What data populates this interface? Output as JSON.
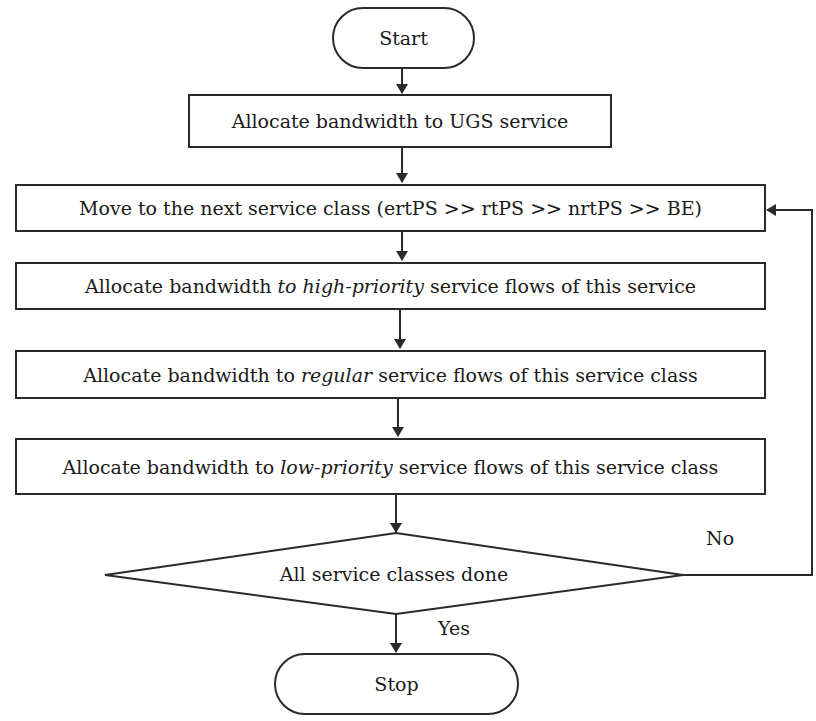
{
  "diagram": {
    "type": "flowchart",
    "nodes": {
      "start": {
        "label": "Start",
        "shape": "terminal"
      },
      "ugs": {
        "label": "Allocate bandwidth to UGS service",
        "shape": "process"
      },
      "next_class": {
        "label": "Move to the next service class (ertPS >> rtPS >> nrtPS >> BE)",
        "shape": "process"
      },
      "high_priority": {
        "pre": "Allocate bandwidth ",
        "em": "to high-priority",
        "post": " service flows of this service",
        "shape": "process"
      },
      "regular": {
        "pre": "Allocate bandwidth to ",
        "em": "regular",
        "post": " service flows of this service class",
        "shape": "process"
      },
      "low_priority": {
        "pre": "Allocate bandwidth to ",
        "em": "low-priority",
        "post": " service flows of this service class",
        "shape": "process"
      },
      "decision": {
        "label": "All service classes done",
        "shape": "decision"
      },
      "stop": {
        "label": "Stop",
        "shape": "terminal"
      }
    },
    "edges": {
      "no_label": "No",
      "yes_label": "Yes"
    },
    "colors": {
      "stroke": "#2a2a2a",
      "background": "#ffffff",
      "text": "#1a1a1a"
    }
  }
}
